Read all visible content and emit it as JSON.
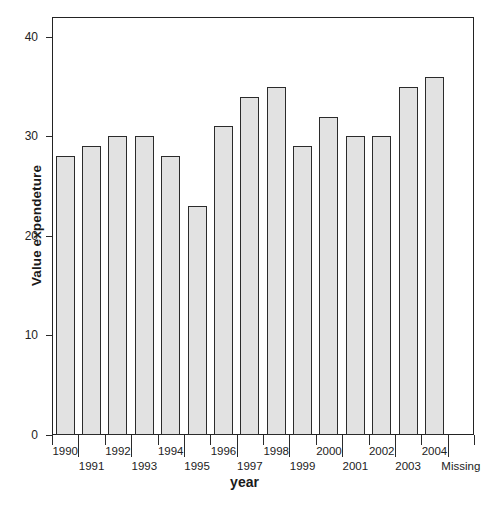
{
  "chart_data": {
    "type": "bar",
    "title": "",
    "subtitle": "",
    "xlabel": "year",
    "ylabel": "Value expendeture",
    "categories": [
      "1990",
      "1991",
      "1992",
      "1993",
      "1994",
      "1995",
      "1996",
      "1997",
      "1998",
      "1999",
      "2000",
      "2001",
      "2002",
      "2003",
      "2004",
      "Missing"
    ],
    "values": [
      28,
      29,
      30,
      30,
      28,
      23,
      31,
      34,
      35,
      29,
      32,
      30,
      30,
      35,
      36,
      0
    ],
    "ylim": [
      0,
      42
    ],
    "ytick_labels": [
      "0",
      "10",
      "20",
      "30",
      "40"
    ],
    "ytick_values": [
      0,
      10,
      20,
      30,
      40
    ],
    "grid": false,
    "legend": null,
    "bar_fill_color": "#e2e2e2",
    "bar_edge_color": "#2b2b2b",
    "axis_color": "#232323",
    "background_color": "#ffffff"
  },
  "axes": {
    "y_title": "Value expendeture",
    "x_title": "year"
  }
}
